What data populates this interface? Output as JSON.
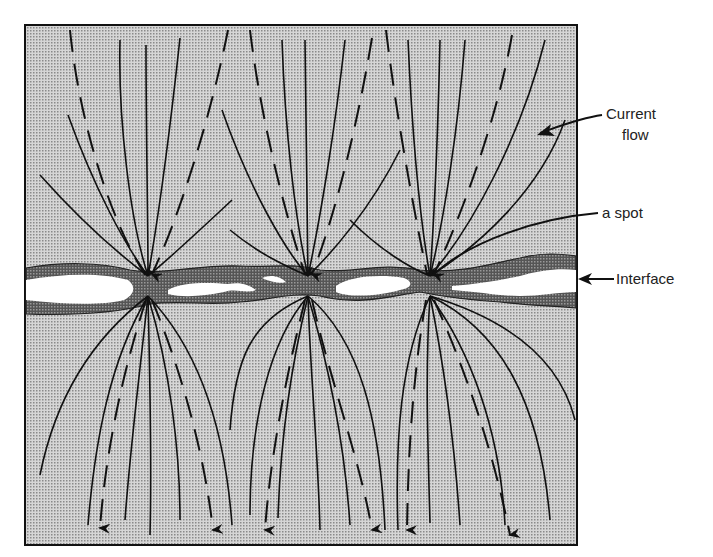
{
  "diagram": {
    "labels": {
      "current_flow_line1": "Current",
      "current_flow_line2": "flow",
      "a_spot": "a spot",
      "interface": "Interface"
    },
    "colors": {
      "stipple_fill": "#c9c9c9",
      "interface_band": "#6a6a6a",
      "gap": "#ffffff",
      "line": "#111111"
    },
    "spots": [
      {
        "name": "a-spot-left",
        "x": 148,
        "y": 283
      },
      {
        "name": "a-spot-middle",
        "x": 308,
        "y": 283
      },
      {
        "name": "a-spot-right",
        "x": 430,
        "y": 283
      }
    ]
  }
}
